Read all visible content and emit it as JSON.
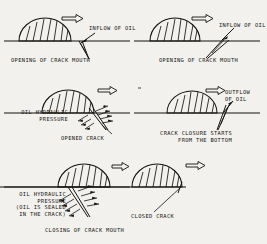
{
  "figure": {
    "background_color": "#f2f1ee",
    "ink_color": "#15130f",
    "panels": [
      {
        "id": "top-left",
        "stage": "opening-of-crack-mouth-a",
        "caption": "OPENING OF CRACK MOUTH",
        "annotation": "INFLOW OF OIL",
        "motion_arrow": "right",
        "crack_state": "narrow-v-open"
      },
      {
        "id": "top-right",
        "stage": "opening-of-crack-mouth-b",
        "caption": "OPENING OF CRACK MOUTH",
        "annotation": "INFLOW OF OIL",
        "motion_arrow": "right",
        "crack_state": "wide-v-open"
      },
      {
        "id": "middle-left",
        "stage": "opened-crack",
        "caption": "OPENED CRACK",
        "annotation_line1": "OIL HYDRAULIC",
        "annotation_line2": "PRESSURE",
        "motion_arrow": "right",
        "crack_state": "opened-pressurised"
      },
      {
        "id": "middle-right",
        "stage": "crack-closure-starts",
        "caption_line1": "CRACK CLOSURE STARTS",
        "caption_line2": "FROM THE BOTTOM",
        "annotation_line1": "OUTFLOW",
        "annotation_line2": "OF OIL",
        "motion_arrow": "right",
        "crack_state": "closing-from-bottom"
      },
      {
        "id": "bottom-left",
        "stage": "closing-of-crack-mouth",
        "caption": "CLOSING OF CRACK MOUTH",
        "annotation_line1": "OIL HYDRAULIC",
        "annotation_line2": "PRESSURE",
        "annotation_line3": "(OIL IS SEALED",
        "annotation_line4": "IN THE CRACK)",
        "motion_arrow": "right",
        "crack_state": "sealed-pressurised"
      },
      {
        "id": "bottom-right",
        "stage": "closed-crack",
        "caption": "CLOSED CRACK",
        "motion_arrow": "right",
        "crack_state": "closed"
      }
    ]
  }
}
